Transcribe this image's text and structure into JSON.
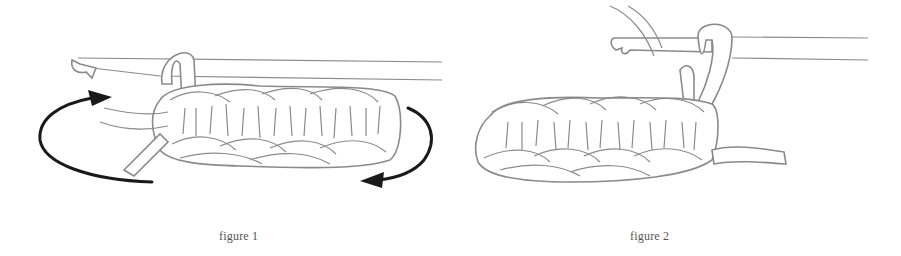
{
  "figures": [
    {
      "id": "figure-1",
      "caption": "figure 1",
      "depiction": "crochet hook holding loop over row of stitches with circular rotation arrows (turn work)"
    },
    {
      "id": "figure-2",
      "caption": "figure 2",
      "depiction": "crochet hook with loops, yarn strand wrapped, row of stitches after turning"
    }
  ],
  "colors": {
    "background": "#ffffff",
    "outline": "#8a8a8a",
    "arrow": "#1a1a1a",
    "caption_text": "#555555"
  }
}
